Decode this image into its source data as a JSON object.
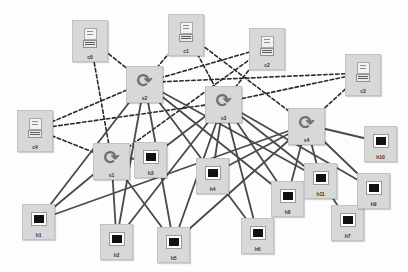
{
  "diagram": {
    "background_color": "#fdfdfd",
    "node_fill": "#d8d8d8",
    "node_border": "#c2c2c2",
    "solid_edge_color": "#4a4a4a",
    "dashed_edge_color": "#2a2a2a",
    "canvas": {
      "width": 408,
      "height": 272
    }
  },
  "nodes": [
    {
      "id": "c0",
      "label": "c0",
      "type": "client",
      "icon": "client-terminal-icon",
      "x": 72,
      "y": 20,
      "w": 36,
      "h": 42
    },
    {
      "id": "c1",
      "label": "c1",
      "type": "client",
      "icon": "client-terminal-icon",
      "x": 168,
      "y": 14,
      "w": 36,
      "h": 42
    },
    {
      "id": "c2",
      "label": "c2",
      "type": "client",
      "icon": "client-terminal-icon",
      "x": 249,
      "y": 28,
      "w": 36,
      "h": 42
    },
    {
      "id": "c3",
      "label": "c3",
      "type": "client",
      "icon": "client-terminal-icon",
      "x": 345,
      "y": 54,
      "w": 36,
      "h": 42
    },
    {
      "id": "c4",
      "label": "c4",
      "type": "client",
      "icon": "client-terminal-icon",
      "x": 17,
      "y": 110,
      "w": 36,
      "h": 42
    },
    {
      "id": "s1",
      "label": "s1",
      "type": "switch",
      "icon": "switch-circular-arrow-icon",
      "x": 93,
      "y": 143,
      "w": 37,
      "h": 37
    },
    {
      "id": "s2",
      "label": "s2",
      "type": "switch",
      "icon": "switch-circular-arrow-icon",
      "x": 126,
      "y": 66,
      "w": 37,
      "h": 37
    },
    {
      "id": "s3",
      "label": "s3",
      "type": "switch",
      "icon": "switch-circular-arrow-icon",
      "x": 205,
      "y": 86,
      "w": 37,
      "h": 37
    },
    {
      "id": "s4",
      "label": "s4",
      "type": "switch",
      "icon": "switch-circular-arrow-icon",
      "x": 288,
      "y": 108,
      "w": 37,
      "h": 37
    },
    {
      "id": "h1",
      "label": "h1",
      "type": "host",
      "icon": "host-monitor-icon",
      "x": 22,
      "y": 204,
      "w": 33,
      "h": 36
    },
    {
      "id": "h2",
      "label": "h2",
      "type": "host",
      "icon": "host-monitor-icon",
      "x": 100,
      "y": 224,
      "w": 33,
      "h": 36
    },
    {
      "id": "h3",
      "label": "h3",
      "type": "host",
      "icon": "host-monitor-icon",
      "x": 134,
      "y": 142,
      "w": 33,
      "h": 36
    },
    {
      "id": "h4",
      "label": "h4",
      "type": "host",
      "icon": "host-monitor-icon",
      "x": 196,
      "y": 158,
      "w": 33,
      "h": 36
    },
    {
      "id": "h5",
      "label": "h5",
      "type": "host",
      "icon": "host-monitor-icon",
      "x": 157,
      "y": 227,
      "w": 33,
      "h": 36
    },
    {
      "id": "h6",
      "label": "h6",
      "type": "host",
      "icon": "host-monitor-icon",
      "x": 241,
      "y": 218,
      "w": 33,
      "h": 36
    },
    {
      "id": "h7",
      "label": "h7",
      "type": "host",
      "icon": "host-monitor-icon",
      "x": 331,
      "y": 205,
      "w": 33,
      "h": 36
    },
    {
      "id": "h8",
      "label": "h8",
      "type": "host",
      "icon": "host-monitor-icon",
      "x": 271,
      "y": 181,
      "w": 33,
      "h": 36
    },
    {
      "id": "h9",
      "label": "h9",
      "type": "host",
      "icon": "host-monitor-icon",
      "x": 357,
      "y": 173,
      "w": 33,
      "h": 36
    },
    {
      "id": "h10",
      "label": "h10",
      "type": "host",
      "icon": "host-monitor-icon",
      "x": 364,
      "y": 126,
      "w": 33,
      "h": 36
    },
    {
      "id": "h11",
      "label": "h11",
      "type": "host",
      "icon": "host-monitor-icon",
      "x": 304,
      "y": 163,
      "w": 33,
      "h": 36
    }
  ],
  "edges": [
    {
      "from": "c0",
      "to": "s2",
      "style": "dashed"
    },
    {
      "from": "c0",
      "to": "s1",
      "style": "dashed"
    },
    {
      "from": "c1",
      "to": "s2",
      "style": "dashed"
    },
    {
      "from": "c1",
      "to": "s3",
      "style": "dashed"
    },
    {
      "from": "c1",
      "to": "s4",
      "style": "dashed"
    },
    {
      "from": "c2",
      "to": "s2",
      "style": "dashed"
    },
    {
      "from": "c2",
      "to": "s3",
      "style": "dashed"
    },
    {
      "from": "c2",
      "to": "s1",
      "style": "dashed"
    },
    {
      "from": "c3",
      "to": "s3",
      "style": "dashed"
    },
    {
      "from": "c3",
      "to": "s4",
      "style": "dashed"
    },
    {
      "from": "c3",
      "to": "s2",
      "style": "dashed"
    },
    {
      "from": "c4",
      "to": "s2",
      "style": "dashed"
    },
    {
      "from": "c4",
      "to": "s3",
      "style": "dashed"
    },
    {
      "from": "c4",
      "to": "s1",
      "style": "dashed"
    },
    {
      "from": "s2",
      "to": "h1",
      "style": "solid"
    },
    {
      "from": "s2",
      "to": "h2",
      "style": "solid"
    },
    {
      "from": "s2",
      "to": "h5",
      "style": "solid"
    },
    {
      "from": "s2",
      "to": "h6",
      "style": "solid"
    },
    {
      "from": "s2",
      "to": "h8",
      "style": "solid"
    },
    {
      "from": "s2",
      "to": "h11",
      "style": "solid"
    },
    {
      "from": "s1",
      "to": "h1",
      "style": "solid"
    },
    {
      "from": "s1",
      "to": "h2",
      "style": "solid"
    },
    {
      "from": "s1",
      "to": "h5",
      "style": "solid"
    },
    {
      "from": "s1",
      "to": "h3",
      "style": "solid"
    },
    {
      "from": "s3",
      "to": "h4",
      "style": "solid"
    },
    {
      "from": "s3",
      "to": "h3",
      "style": "solid"
    },
    {
      "from": "s3",
      "to": "h2",
      "style": "solid"
    },
    {
      "from": "s3",
      "to": "h5",
      "style": "solid"
    },
    {
      "from": "s3",
      "to": "h6",
      "style": "solid"
    },
    {
      "from": "s3",
      "to": "h8",
      "style": "solid"
    },
    {
      "from": "s3",
      "to": "h11",
      "style": "solid"
    },
    {
      "from": "s3",
      "to": "h9",
      "style": "solid"
    },
    {
      "from": "s4",
      "to": "h4",
      "style": "solid"
    },
    {
      "from": "s4",
      "to": "h5",
      "style": "solid"
    },
    {
      "from": "s4",
      "to": "h8",
      "style": "solid"
    },
    {
      "from": "s4",
      "to": "h11",
      "style": "solid"
    },
    {
      "from": "s4",
      "to": "h9",
      "style": "solid"
    },
    {
      "from": "s4",
      "to": "h10",
      "style": "solid"
    },
    {
      "from": "s4",
      "to": "h1",
      "style": "solid"
    },
    {
      "from": "h11",
      "to": "h7",
      "style": "solid"
    }
  ]
}
